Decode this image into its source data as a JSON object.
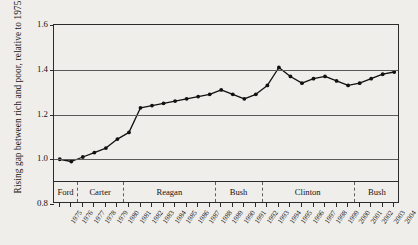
{
  "chart_data": {
    "type": "line",
    "title": "",
    "xlabel": "",
    "ylabel": "Rising gap between rich and poor, relative to 1975",
    "ylim": [
      0.8,
      1.6
    ],
    "yticks": [
      "0.8",
      "1.0",
      "1.2",
      "1.4",
      "1.6"
    ],
    "ytick_values": [
      0.8,
      1.0,
      1.2,
      1.4,
      1.6
    ],
    "grid": true,
    "legend": "none",
    "marker": "filled-circle",
    "line_color": "#111111",
    "x": [
      1975,
      1976,
      1977,
      1978,
      1979,
      1980,
      1981,
      1982,
      1983,
      1984,
      1985,
      1986,
      1987,
      1988,
      1989,
      1990,
      1991,
      1992,
      1993,
      1994,
      1995,
      1996,
      1997,
      1998,
      1999,
      2000,
      2001,
      2002,
      2003,
      2004
    ],
    "xtick_labels": [
      "1975",
      "1976",
      "1977",
      "1978",
      "1979",
      "1980",
      "1981",
      "1982",
      "1983",
      "1984",
      "1985",
      "1986",
      "1987",
      "1988",
      "1989",
      "1990",
      "1991",
      "1992",
      "1993",
      "1994",
      "1995",
      "1996",
      "1997",
      "1998",
      "1999",
      "2000",
      "2001",
      "2002",
      "2003",
      "2004"
    ],
    "values": [
      1.0,
      0.99,
      1.01,
      1.03,
      1.05,
      1.09,
      1.12,
      1.23,
      1.24,
      1.25,
      1.26,
      1.27,
      1.28,
      1.29,
      1.31,
      1.29,
      1.27,
      1.29,
      1.33,
      1.41,
      1.37,
      1.34,
      1.36,
      1.37,
      1.35,
      1.33,
      1.34,
      1.36,
      1.38,
      1.39
    ],
    "presidents": [
      {
        "label": "Ford",
        "start": 1975,
        "end": 1977
      },
      {
        "label": "Carter",
        "start": 1977,
        "end": 1981
      },
      {
        "label": "Reagan",
        "start": 1981,
        "end": 1989
      },
      {
        "label": "Bush",
        "start": 1989,
        "end": 1993
      },
      {
        "label": "Clinton",
        "start": 1993,
        "end": 2001
      },
      {
        "label": "Bush",
        "start": 2001,
        "end": 2005
      }
    ]
  }
}
